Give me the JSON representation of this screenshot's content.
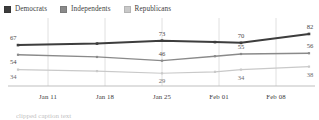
{
  "legend": {
    "position": "top-left",
    "items": [
      {
        "label": "Democrats",
        "color": "#3d3d3d",
        "icon": "square-swatch-icon"
      },
      {
        "label": "Independents",
        "color": "#8a8a8a",
        "icon": "square-swatch-icon"
      },
      {
        "label": "Republicans",
        "color": "#c9c9c9",
        "icon": "square-swatch-icon"
      }
    ]
  },
  "footer": {
    "text": "clipped caption text"
  },
  "chart_data": {
    "type": "line",
    "title": "",
    "subtitle": "",
    "xlabel": "",
    "ylabel": "",
    "grid": "vertical",
    "legend_position": "top-left",
    "x": [
      "Jan 11",
      "Jan 18",
      "Jan 25",
      "Feb 01",
      "Feb 04",
      "Feb 08"
    ],
    "xtick_labels": [
      "Jan 11",
      "Jan 18",
      "Jan 25",
      "Feb 01",
      "Feb 08"
    ],
    "ylim": [
      20,
      90
    ],
    "series": [
      {
        "name": "Democrats",
        "color": "#3d3d3d",
        "values": [
          67,
          69,
          73,
          71,
          70,
          82
        ],
        "point_labels": [
          "67",
          "",
          "73",
          "",
          "70",
          "82"
        ]
      },
      {
        "name": "Independents",
        "color": "#8a8a8a",
        "values": [
          54,
          51,
          46,
          52,
          55,
          56
        ],
        "point_labels": [
          "54",
          "",
          "46",
          "",
          "55",
          "56"
        ]
      },
      {
        "name": "Republicans",
        "color": "#c9c9c9",
        "values": [
          34,
          32,
          29,
          31,
          34,
          38
        ],
        "point_labels": [
          "34",
          "",
          "29",
          "",
          "34",
          "38"
        ]
      }
    ]
  }
}
